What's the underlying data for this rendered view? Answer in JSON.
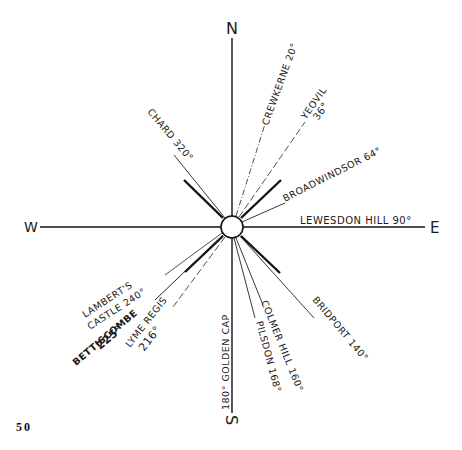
{
  "diagram": {
    "type": "compass-bearing-diagram",
    "center": {
      "x": 232,
      "y": 227,
      "radius": 11
    },
    "cardinals": {
      "north": "N",
      "south": "S",
      "east": "E",
      "west": "W"
    },
    "bearings": [
      {
        "place": "CREWKERNE",
        "degrees": 20,
        "label": "CREWKERNE 20°"
      },
      {
        "place": "YEOVIL",
        "degrees": 36,
        "label": "YEOVIL 36°"
      },
      {
        "place": "BROADWINDSOR",
        "degrees": 64,
        "label": "BROADWINDSOR 64°"
      },
      {
        "place": "LEWESDON HILL",
        "degrees": 90,
        "label": "LEWESDON HILL 90°"
      },
      {
        "place": "BRIDPORT",
        "degrees": 140,
        "label": "BRIDPORT 140°"
      },
      {
        "place": "COLMER HILL",
        "degrees": 160,
        "label": "COLMER HILL 160°"
      },
      {
        "place": "PILSDON",
        "degrees": 168,
        "label": "PILSDON 168°"
      },
      {
        "place": "GOLDEN CAP",
        "degrees": 180,
        "label": "180° GOLDEN CAP"
      },
      {
        "place": "LYME REGIS",
        "degrees": 216,
        "label_line1": "LYME REGIS",
        "label_line2": "216°"
      },
      {
        "place": "BETTISCOMBE",
        "degrees": 225,
        "label_line1": "BETTISCOMBE",
        "label_line2": "225°"
      },
      {
        "place": "LAMBERT'S CASTLE",
        "degrees": 240,
        "label_line1": "LAMBERT'S",
        "label_line2": "CASTLE 240°"
      },
      {
        "place": "CHARD",
        "degrees": 320,
        "label": "CHARD 320°"
      }
    ]
  },
  "page_number": "50"
}
